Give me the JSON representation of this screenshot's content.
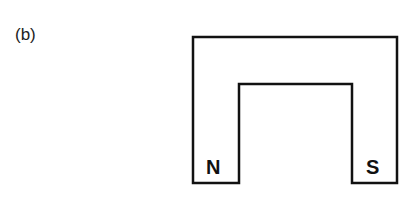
{
  "figure": {
    "label": "(b)",
    "magnet": {
      "type": "horseshoe-magnet",
      "north_label": "N",
      "south_label": "S"
    }
  }
}
